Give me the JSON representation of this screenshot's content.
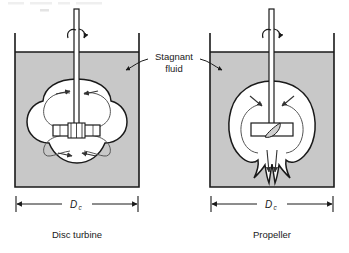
{
  "figure": {
    "title_fragment_top": "",
    "callout": {
      "line1": "Stagnant",
      "line2": "fluid"
    },
    "colors": {
      "stagnant_fluid_fill": "#c8c8c8",
      "mixed_cavity_fill": "#ffffff",
      "outline": "#1a1a1a",
      "flow_line": "#555555",
      "background": "#ffffff"
    },
    "vessels": [
      {
        "id": "disc-turbine",
        "caption": "Disc turbine",
        "dimension_label": "D",
        "dimension_subscript": "c",
        "impeller_type": "disc-turbine",
        "flow_pattern": "radial four-lobe",
        "rotation_indicator": "curved-arrow",
        "loop_arrow_count": 4
      },
      {
        "id": "propeller",
        "caption": "Propeller",
        "dimension_label": "D",
        "dimension_subscript": "c",
        "impeller_type": "propeller",
        "flow_pattern": "axial bell-shaped",
        "rotation_indicator": "curved-arrow",
        "loop_arrow_count": 2
      }
    ]
  }
}
